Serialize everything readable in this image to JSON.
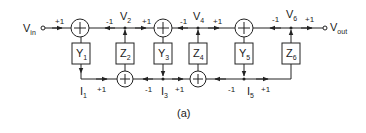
{
  "diagram": {
    "caption": "(a)",
    "input_label": "V",
    "input_sub": "in",
    "output_label": "V",
    "output_sub": "out",
    "nodes": {
      "v2": {
        "label": "V",
        "sub": "2"
      },
      "v4": {
        "label": "V",
        "sub": "4"
      },
      "v6": {
        "label": "V",
        "sub": "6"
      },
      "i1": {
        "label": "I",
        "sub": "1"
      },
      "i3": {
        "label": "I",
        "sub": "3"
      },
      "i5": {
        "label": "I",
        "sub": "5"
      }
    },
    "blocks": [
      {
        "label": "Y",
        "sub": "1"
      },
      {
        "label": "Z",
        "sub": "2"
      },
      {
        "label": "Y",
        "sub": "3"
      },
      {
        "label": "Z",
        "sub": "4"
      },
      {
        "label": "Y",
        "sub": "5"
      },
      {
        "label": "Z",
        "sub": "6"
      }
    ],
    "gains": {
      "in_plus": "+1",
      "v2_minus": "-1",
      "v2_plus": "+1",
      "v4_minus": "-1",
      "v4_plus": "+1",
      "v6_minus": "-1",
      "v6_plus": "+1",
      "i1_plus": "+1",
      "i3_minus": "-1",
      "i3_plus": "+1",
      "i5_minus": "-1",
      "i5_plus": "+1"
    },
    "summer_symbol": "+"
  }
}
